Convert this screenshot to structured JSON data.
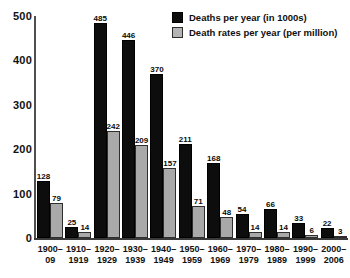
{
  "chart_data": {
    "type": "bar",
    "title": "",
    "xlabel": "",
    "ylabel": "",
    "ylim": [
      0,
      500
    ],
    "ytick_labels": [
      "500",
      "400",
      "300",
      "200",
      "100",
      "0"
    ],
    "yticks": [
      500,
      400,
      300,
      200,
      100,
      0
    ],
    "grid": false,
    "legend_position": "top-right",
    "categories": [
      {
        "line1": "1900–",
        "line2": "09"
      },
      {
        "line1": "1910–",
        "line2": "1919"
      },
      {
        "line1": "1920–",
        "line2": "1929"
      },
      {
        "line1": "1930–",
        "line2": "1939"
      },
      {
        "line1": "1940–",
        "line2": "1949"
      },
      {
        "line1": "1950–",
        "line2": "1959"
      },
      {
        "line1": "1960–",
        "line2": "1969"
      },
      {
        "line1": "1970–",
        "line2": "1979"
      },
      {
        "line1": "1980–",
        "line2": "1989"
      },
      {
        "line1": "1990–",
        "line2": "1999"
      },
      {
        "line1": "2000–",
        "line2": "2006"
      }
    ],
    "series": [
      {
        "name": "Deaths per year (in 1000s)",
        "color": "#0d0d0d",
        "values": [
          128,
          25,
          485,
          446,
          370,
          211,
          168,
          54,
          66,
          33,
          22
        ]
      },
      {
        "name": "Death rates per year (per million)",
        "color": "#a9a9a9",
        "values": [
          79,
          14,
          242,
          209,
          157,
          71,
          48,
          14,
          14,
          6,
          3
        ]
      }
    ]
  },
  "legend": {
    "items": [
      {
        "label": "Deaths per year (in 1000s)",
        "swatch": "black"
      },
      {
        "label": "Death rates per year (per million)",
        "swatch": "gray"
      }
    ]
  }
}
